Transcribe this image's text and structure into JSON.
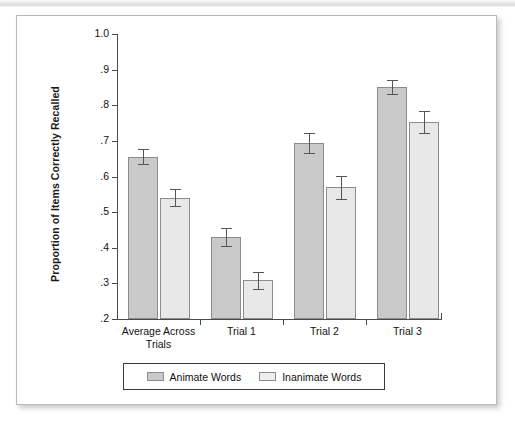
{
  "figure": {
    "background_color": "#ffffff",
    "border_color": "#b9b9b9"
  },
  "chart_data": {
    "type": "bar",
    "title": "",
    "subtitle": "",
    "xlabel": "",
    "ylabel": "Proportion of Items Correctly Recalled",
    "categories": [
      "Average Across\nTrials",
      "Trial 1",
      "Trial 2",
      "Trial 3"
    ],
    "ylim": [
      0.2,
      1.0
    ],
    "yticks": [
      0.2,
      0.3,
      0.4,
      0.5,
      0.6,
      0.7,
      0.8,
      0.9,
      1.0
    ],
    "ytick_labels": [
      ".2",
      ".3",
      ".4",
      ".5",
      ".6",
      ".7",
      ".8",
      ".9",
      "1.0"
    ],
    "grid": false,
    "legend_position": "bottom-center",
    "series": [
      {
        "name": "Animate Words",
        "color": "#c9c9c9",
        "values": [
          0.655,
          0.43,
          0.695,
          0.851
        ],
        "errors": [
          0.021,
          0.026,
          0.028,
          0.019
        ]
      },
      {
        "name": "Inanimate Words",
        "color": "#e8e8e8",
        "values": [
          0.54,
          0.309,
          0.57,
          0.753
        ],
        "errors": [
          0.024,
          0.024,
          0.032,
          0.032
        ]
      }
    ]
  },
  "axis": {
    "tick_color": "#4a4a4a",
    "label_color": "#111111"
  },
  "legend": {
    "entries": [
      {
        "label": "Animate Words",
        "swatch": "animate"
      },
      {
        "label": "Inanimate Words",
        "swatch": "inanimate"
      }
    ]
  }
}
